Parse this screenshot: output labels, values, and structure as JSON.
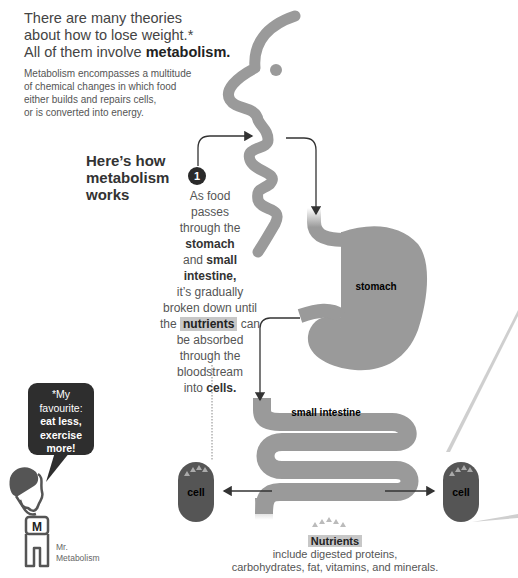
{
  "intro": {
    "line1": "There are many theories",
    "line2": "about how to lose weight.*",
    "line3_prefix": "All of them involve ",
    "line3_bold": "metabolism."
  },
  "description": {
    "lines": [
      "Metabolism encompasses a multitude",
      "of chemical changes in which food",
      "either builds and repairs cells,",
      "or is converted into energy."
    ]
  },
  "heading": {
    "lines": [
      "Here’s how",
      "metabolism",
      "works"
    ]
  },
  "step": {
    "number": "1",
    "text": {
      "l1": "As food",
      "l2": "passes",
      "l3": "through the",
      "l4_bold": "stomach",
      "l5_prefix": "and ",
      "l5_bold": "small",
      "l6_bold": "intestine,",
      "l7": "it’s gradually",
      "l8": "broken down until",
      "l9_prefix": "the ",
      "l9_highlight": "nutrients",
      "l9_suffix": " can",
      "l10": "be absorbed",
      "l11": "through the",
      "l12": "bloodstream",
      "l13_prefix": "into ",
      "l13_bold": "cells."
    }
  },
  "organs": {
    "stomach_label": "stomach",
    "intestine_label": "small intestine",
    "cell_label": "cell"
  },
  "speech_bubble": {
    "l1": "*My",
    "l2": "favourite:",
    "l3_bold": "eat less,",
    "l4_bold": "exercise",
    "l5_bold": "more!"
  },
  "character": {
    "shirt_letter": "M",
    "name_l1": "Mr.",
    "name_l2": "Metabolism"
  },
  "nutrients": {
    "title": "Nutrients",
    "line1": "include digested proteins,",
    "line2": "carbohydrates, fat, vitamins, and minerals."
  },
  "colors": {
    "organ_gray": "#9a9a9a",
    "cell_dark": "#555555",
    "arrow": "#333333",
    "bubble": "#2e2e2e",
    "highlight": "#c7c7c7"
  }
}
